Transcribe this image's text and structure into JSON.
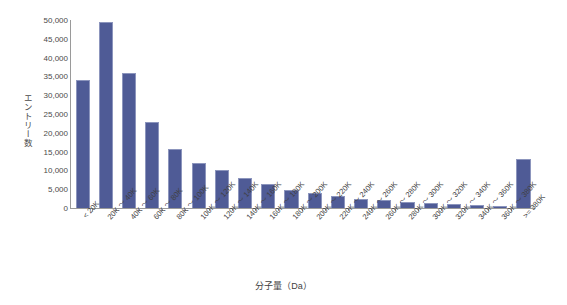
{
  "chart_data": {
    "type": "bar",
    "title": "",
    "xlabel": "分子量（Da）",
    "ylabel": "エントリー数",
    "ylim": [
      0,
      50000
    ],
    "ytick_step": 5000,
    "grid": false,
    "legend": null,
    "bar_color": "#4f5b96",
    "bar_border_color": "#8c95bd",
    "axis_color": "#9a9a9a",
    "categories": [
      "< 20K",
      "20K ～ 40K",
      "40K ～ 60K",
      "60K ～ 80K",
      "80K ～ 100K",
      "100K ～ 120K",
      "120K ～ 140K",
      "140K ～ 160K",
      "160K ～ 180K",
      "180K ～ 200K",
      "200K ～ 220K",
      "220K ～ 240K",
      "240K ～ 260K",
      "260K ～ 280K",
      "280K ～ 300K",
      "300K ～ 320K",
      "320K ～ 340K",
      "340K ～ 360K",
      "360K ～ 380K",
      ">= 380K"
    ],
    "values": [
      34000,
      49400,
      35800,
      23000,
      15600,
      12000,
      10000,
      8000,
      6400,
      4800,
      3900,
      3100,
      2500,
      2000,
      1600,
      1300,
      1000,
      800,
      600,
      13000
    ],
    "yticks": [
      "50,000",
      "45,000",
      "40,000",
      "35,000",
      "30,000",
      "25,000",
      "20,000",
      "15,000",
      "10,000",
      "5,000",
      "0"
    ],
    "ytick_values": [
      50000,
      45000,
      40000,
      35000,
      30000,
      25000,
      20000,
      15000,
      10000,
      5000,
      0
    ]
  }
}
